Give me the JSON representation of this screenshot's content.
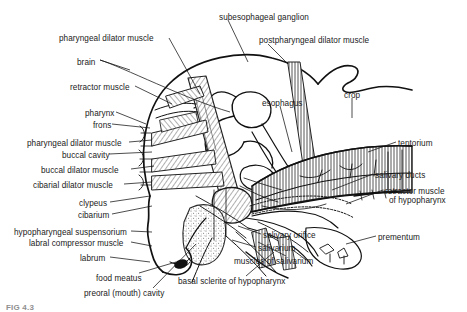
{
  "figure": {
    "type": "anatomical-line-diagram",
    "caption_partial": "FIG 4.3"
  },
  "labels": {
    "left_column": [
      {
        "text": "pharyngeal dilator muscle",
        "x": 59,
        "y": 34,
        "align": "left"
      },
      {
        "text": "brain",
        "x": 77,
        "y": 58,
        "align": "left"
      },
      {
        "text": "retractor muscle",
        "x": 70,
        "y": 83,
        "align": "left"
      },
      {
        "text": "pharynx",
        "x": 85,
        "y": 109,
        "align": "left"
      },
      {
        "text": "frons",
        "x": 93,
        "y": 121,
        "align": "left"
      },
      {
        "text": "pharyngeal dilator muscle",
        "x": 27,
        "y": 139,
        "align": "left"
      },
      {
        "text": "buccal cavity",
        "x": 62,
        "y": 151,
        "align": "left"
      },
      {
        "text": "buccal dilator muscle",
        "x": 41,
        "y": 166,
        "align": "left"
      },
      {
        "text": "cibarial dilator muscle",
        "x": 33,
        "y": 181,
        "align": "left"
      },
      {
        "text": "clypeus",
        "x": 79,
        "y": 199,
        "align": "left"
      },
      {
        "text": "cibarium",
        "x": 78,
        "y": 211,
        "align": "left"
      },
      {
        "text": "hypopharyngeal suspensorium",
        "x": 14,
        "y": 228,
        "align": "left"
      },
      {
        "text": "labral compressor muscle",
        "x": 29,
        "y": 239,
        "align": "left"
      },
      {
        "text": "labrum",
        "x": 80,
        "y": 254,
        "align": "left"
      },
      {
        "text": "food meatus",
        "x": 96,
        "y": 274,
        "align": "left"
      },
      {
        "text": "preoral (mouth) cavity",
        "x": 84,
        "y": 289,
        "align": "left"
      }
    ],
    "top_column": [
      {
        "text": "subesophageal ganglion",
        "x": 219,
        "y": 13,
        "align": "left"
      },
      {
        "text": "postpharyngeal dilator muscle",
        "x": 259,
        "y": 36,
        "align": "left"
      }
    ],
    "right_column": [
      {
        "text": "esophagus",
        "x": 262,
        "y": 99,
        "align": "left"
      },
      {
        "text": "crop",
        "x": 344,
        "y": 91,
        "align": "left"
      },
      {
        "text": "tentorium",
        "x": 398,
        "y": 139,
        "align": "left"
      },
      {
        "text": "salivary ducts",
        "x": 375,
        "y": 171,
        "align": "left"
      },
      {
        "text": "retractor muscle",
        "x": 385,
        "y": 187,
        "align": "left"
      },
      {
        "text": "of hypopharynx",
        "x": 389,
        "y": 196,
        "align": "left"
      },
      {
        "text": "prementum",
        "x": 378,
        "y": 233,
        "align": "left"
      }
    ],
    "bottom_column": [
      {
        "text": "salivary orifice",
        "x": 263,
        "y": 231,
        "align": "left"
      },
      {
        "text": "salivarium",
        "x": 258,
        "y": 244,
        "align": "left"
      },
      {
        "text": "muscles of salivarium",
        "x": 234,
        "y": 257,
        "align": "left"
      },
      {
        "text": "basal sclerite of hypopharynx",
        "x": 178,
        "y": 277,
        "align": "left"
      }
    ]
  },
  "colors": {
    "ink": "#1a1a1a",
    "paper": "#ffffff",
    "stipple": "#6d6d6d",
    "hatch": "#3a3a3a",
    "caption": "#8f8f8f"
  }
}
